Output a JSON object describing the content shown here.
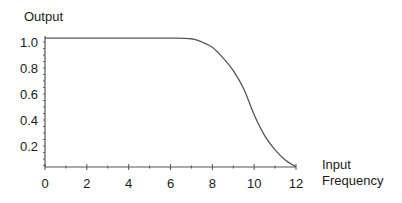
{
  "chart_data": {
    "type": "line",
    "title": "",
    "xlabel": "Input Frequency",
    "ylabel": "Output",
    "xlim": [
      0,
      12
    ],
    "ylim": [
      0,
      1.05
    ],
    "x_ticks": [
      0,
      2,
      4,
      6,
      8,
      10,
      12
    ],
    "y_ticks": [
      0.2,
      0.4,
      0.6,
      0.8,
      1.0
    ],
    "x_tick_labels": [
      "0",
      "2",
      "4",
      "6",
      "8",
      "10",
      "12"
    ],
    "y_tick_labels": [
      "0.2",
      "0.4",
      "0.6",
      "0.8",
      "1.0"
    ],
    "grid": false,
    "legend": null,
    "series": [
      {
        "name": "Output",
        "x": [
          0,
          1,
          2,
          3,
          4,
          5,
          6,
          7,
          7.5,
          8,
          8.5,
          9,
          9.5,
          10,
          10.5,
          11,
          11.5,
          12
        ],
        "y": [
          1.03,
          1.03,
          1.03,
          1.03,
          1.03,
          1.03,
          1.03,
          1.025,
          1.0,
          0.96,
          0.88,
          0.78,
          0.64,
          0.44,
          0.28,
          0.17,
          0.09,
          0.04
        ]
      }
    ]
  },
  "labels": {
    "y_axis_title": "Output",
    "x_axis_title_line1": "Input",
    "x_axis_title_line2": "Frequency"
  }
}
